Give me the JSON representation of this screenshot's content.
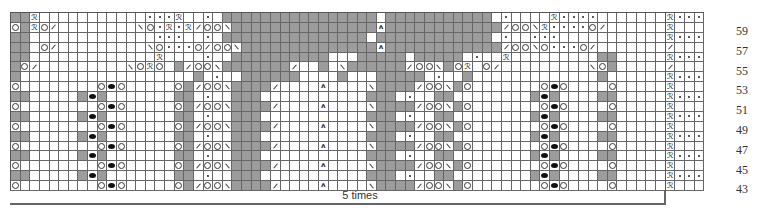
{
  "chart": {
    "columns": 68,
    "side_columns": 4,
    "row_numbers": [
      "59",
      "57",
      "55",
      "53",
      "51",
      "49",
      "47",
      "45",
      "43"
    ],
    "repeat_label": "5 times",
    "colors": {
      "gray": "#9c9c9c",
      "grid": "#666666",
      "white": "#ffffff"
    },
    "legend_codes": {
      ".": "knit (white)",
      "g": "no stitch (gray)",
      "o": "yarn over",
      "/": "k2tog",
      "\\": "ssk",
      "*": "purl",
      "x": "twisted stitch",
      "A": "centered double decrease",
      "b": "bobble"
    },
    "rows": [
      {
        "n": 60,
        "main": "ggx...........***x..*.gggggggggggggggg.ggggggggggg.*....x****.............xg",
        "side": "x***"
      },
      {
        "n": 59,
        "main": "ogxo/........\\o*x*x/oo\\gggggggggggggggAgggggggggggg/oo\\x****o/.......\\oxgo",
        "side": "x..."
      },
      {
        "n": 58,
        "main": "gg.............***..*.ggggggggggggggg.gggggggggggg.*..***...........gg",
        "side": "x***"
      },
      {
        "n": 57,
        "main": "gg.o/.........\\o***o/oo\\ggggggggggggggAgggggggggggg/oo\\o***o/.......\\ogg",
        "side": "/..."
      },
      {
        "n": 56,
        "main": "gg.............x....*..gggggggggg...ggggg.ggggg.*..x.........gg",
        "side": "x***"
      },
      {
        "n": 55,
        "main": "go/.........\\oxo.g/oo\\ggggggg/..g.\\gggggg/oo\\gox o/.........\\og",
        "side": "/..."
      },
      {
        "n": 54,
        "main": "g..................g.*..gggggg....g...ggggg.*..g.............g",
        "side": "x***"
      },
      {
        "n": 53,
        "main": "o........obo.....og/oo\\gggg/....A....\\gggg/oo\\go.......obo....o",
        "side": "x..."
      },
      {
        "n": 52,
        "main": "gg.....gbg.......gg.*..ggg...........ggg.*..gg........gbg....gg",
        "side": "x***"
      }
    ]
  }
}
